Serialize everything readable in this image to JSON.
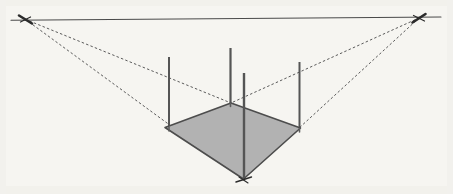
{
  "figure": {
    "type": "perspective-diagram",
    "canvas": {
      "width": 453,
      "height": 194
    },
    "background_color": "#f6f5f1",
    "paper_tint": "#f3f2ee"
  },
  "colors": {
    "horizon_line": "#4a4a4a",
    "construction_dashed": "#5a5a5a",
    "pole_stroke": "#555555",
    "ground_fill": "#b2b2b2",
    "ground_edge": "#4d4d4d",
    "vanishing_point_mark": "#2b2b2b",
    "tick_mark": "#3a3a3a"
  },
  "horizon": {
    "label": "horizon-line",
    "x1": 11,
    "y1": 20.2,
    "x2": 441,
    "y2": 17.0,
    "stroke_width": 1.1
  },
  "vanishing_points": [
    {
      "name": "left-vanishing-point",
      "x": 25.5,
      "y": 19.4
    },
    {
      "name": "right-vanishing-point",
      "x": 419.0,
      "y": 18.0
    }
  ],
  "ground_plane": {
    "name": "ground-quadrilateral",
    "points": [
      {
        "name": "left-corner",
        "x": 165.0,
        "y": 127.5
      },
      {
        "name": "far-corner",
        "x": 231.0,
        "y": 103.0
      },
      {
        "name": "right-corner",
        "x": 300.5,
        "y": 128.0
      },
      {
        "name": "near-corner",
        "x": 243.5,
        "y": 179.0
      }
    ],
    "fill": "#b2b2b2",
    "fill_opacity": 1,
    "edge_width": 1.6
  },
  "poles": [
    {
      "name": "pole-left",
      "x": 169.0,
      "y_top": 57.0,
      "y_base": 127.5,
      "width": 2.0
    },
    {
      "name": "pole-far",
      "x": 230.5,
      "y_top": 48.0,
      "y_base": 103.5,
      "width": 2.2
    },
    {
      "name": "pole-near",
      "x": 244.0,
      "y_top": 73.0,
      "y_base": 179.5,
      "width": 2.4
    },
    {
      "name": "pole-right",
      "x": 299.5,
      "y_top": 62.0,
      "y_base": 128.5,
      "width": 2.0
    }
  ],
  "construction_lines": [
    {
      "name": "dashed-left-vp-to-far-top",
      "from": "left-vanishing-point",
      "x1": 25.5,
      "y1": 19.4,
      "x2": 231.0,
      "y2": 103.0
    },
    {
      "name": "dashed-left-vp-to-near-base",
      "from": "left-vanishing-point",
      "x1": 25.5,
      "y1": 19.4,
      "x2": 243.5,
      "y2": 179.0
    },
    {
      "name": "dashed-right-vp-to-far-top",
      "from": "right-vanishing-point",
      "x1": 419.0,
      "y1": 18.0,
      "x2": 231.0,
      "y2": 103.0
    },
    {
      "name": "dashed-right-vp-to-near-base",
      "from": "right-vanishing-point",
      "x1": 419.0,
      "y1": 18.0,
      "x2": 243.5,
      "y2": 179.0
    }
  ],
  "tick_marks": [
    {
      "name": "tick-left-vp",
      "x": 25.5,
      "y": 19.4,
      "angle": 28,
      "length": 13
    },
    {
      "name": "tick-right-vp",
      "x": 419.0,
      "y": 18.0,
      "angle": -28,
      "length": 13
    },
    {
      "name": "tick-near-corner",
      "x": 243.5,
      "y": 179.0,
      "angle": 18,
      "length": 15
    }
  ],
  "dash_pattern": "1.7 3.0"
}
